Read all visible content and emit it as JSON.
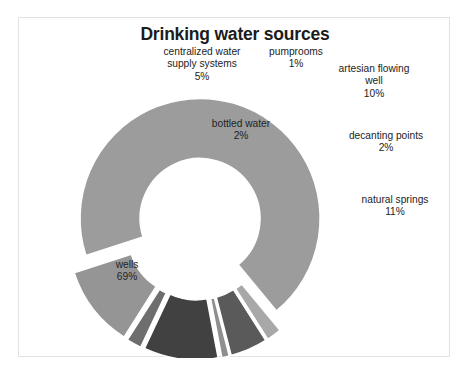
{
  "chart_data": {
    "type": "pie",
    "title": "Drinking water sources",
    "subtitle": "",
    "xlabel": "",
    "ylabel": "",
    "legend_position": "none",
    "grid": false,
    "donut": true,
    "exploded": true,
    "units": "%",
    "categories": [
      "wells",
      "bottled water",
      "centralized water supply systems",
      "pumprooms",
      "artesian flowing well",
      "decanting points",
      "natural springs"
    ],
    "values": [
      69,
      2,
      5,
      1,
      10,
      2,
      11
    ],
    "value_labels": [
      "69%",
      "2%",
      "5%",
      "1%",
      "10%",
      "2%",
      "11%"
    ],
    "colors": [
      "#9c9c9c",
      "#a8a8a8",
      "#5a5a5a",
      "#8f8f8f",
      "#414141",
      "#6e6e6e",
      "#959595"
    ],
    "slices": [
      {
        "name": "wells",
        "label_line1": "wells",
        "label_line2": "",
        "value": 69,
        "pct": "69%",
        "color": "#9c9c9c"
      },
      {
        "name": "bottled",
        "label_line1": "bottled water",
        "label_line2": "",
        "value": 2,
        "pct": "2%",
        "color": "#a8a8a8"
      },
      {
        "name": "central",
        "label_line1": "centralized water",
        "label_line2": "supply systems",
        "value": 5,
        "pct": "5%",
        "color": "#5a5a5a"
      },
      {
        "name": "pump",
        "label_line1": "pumprooms",
        "label_line2": "",
        "value": 1,
        "pct": "1%",
        "color": "#8f8f8f"
      },
      {
        "name": "artesian",
        "label_line1": "artesian flowing",
        "label_line2": "well",
        "value": 10,
        "pct": "10%",
        "color": "#414141"
      },
      {
        "name": "decant",
        "label_line1": "decanting points",
        "label_line2": "",
        "value": 2,
        "pct": "2%",
        "color": "#6e6e6e"
      },
      {
        "name": "springs",
        "label_line1": "natural springs",
        "label_line2": "",
        "value": 11,
        "pct": "11%",
        "color": "#959595"
      }
    ]
  },
  "frame": {
    "border_color": "#e2e2e2",
    "background": "#ffffff"
  }
}
